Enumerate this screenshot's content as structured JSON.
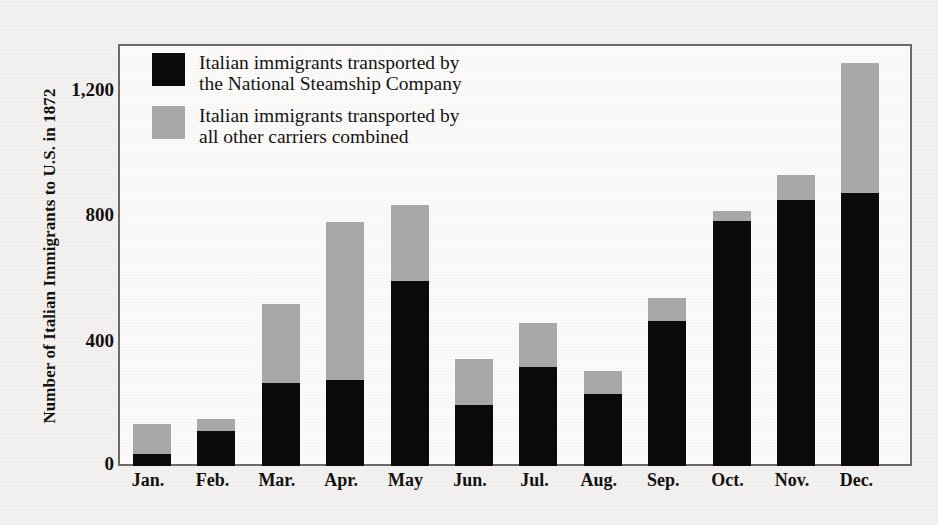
{
  "chart_data": {
    "type": "bar",
    "stacked": true,
    "title": "",
    "subtitle": "",
    "xlabel": "",
    "ylabel": "Number of Italian Immigrants to U.S. in 1872",
    "categories": [
      "Jan.",
      "Feb.",
      "Mar.",
      "Apr.",
      "May",
      "Jun.",
      "Jul.",
      "Aug.",
      "Sep.",
      "Oct.",
      "Nov.",
      "Dec."
    ],
    "series": [
      {
        "name": "Italian immigrants transported by the National Steamship Company",
        "color": "#0a0a0a",
        "values": [
          38,
          112,
          265,
          277,
          593,
          195,
          316,
          230,
          466,
          785,
          854,
          874
        ]
      },
      {
        "name": "Italian immigrants transported by all other carriers combined",
        "color": "#a9a9a9",
        "values": [
          98,
          40,
          255,
          505,
          243,
          149,
          143,
          73,
          73,
          31,
          80,
          418
        ]
      }
    ],
    "totals": [
      136,
      152,
      520,
      782,
      836,
      344,
      459,
      303,
      539,
      816,
      934,
      1292
    ],
    "ylim": [
      0,
      1346
    ],
    "yticks": [
      0,
      400,
      800,
      1200
    ],
    "ytick_labels": [
      "0",
      "400",
      "800",
      "1,200"
    ],
    "grid": false,
    "legend_position": "upper-left-inside"
  },
  "axis": {
    "y_title": "Number of Italian Immigrants to U.S. in 1872",
    "y_tick_labels": [
      "1,200",
      "800",
      "400",
      "0"
    ],
    "x_tick_labels": [
      "Jan.",
      "Feb.",
      "Mar.",
      "Apr.",
      "May",
      "Jun.",
      "Jul.",
      "Aug.",
      "Sep.",
      "Oct.",
      "Nov.",
      "Dec."
    ]
  },
  "legend": {
    "entries": [
      {
        "swatch": "black",
        "line1": "Italian immigrants transported by",
        "line2": "the National Steamship Company"
      },
      {
        "swatch": "gray",
        "line1": "Italian immigrants transported by",
        "line2": "all other carriers combined"
      }
    ]
  },
  "colors": {
    "black_series": "#0a0a0a",
    "gray_series": "#a9a9a9",
    "frame": "#6b6b6b",
    "page_background": "#f2f1ef",
    "plot_background": "#fbfaf8"
  }
}
